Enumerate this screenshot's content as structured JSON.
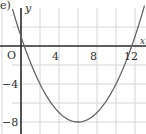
{
  "part_label": "e)",
  "chart_data": {
    "type": "line",
    "title": "",
    "xlabel": "x",
    "ylabel": "y",
    "origin_label": "O",
    "x_ticks": [
      4,
      8,
      12
    ],
    "y_ticks": [
      -4,
      -8
    ],
    "x_tick_labels": [
      "4",
      "8",
      "12"
    ],
    "y_tick_labels": [
      "−4",
      "−8"
    ],
    "xlim": [
      -2,
      13
    ],
    "ylim": [
      -9,
      4
    ],
    "grid": true,
    "grid_step": 2,
    "series": [
      {
        "name": "parabola",
        "equation": "y = 0.25(x-6)^2 - 8",
        "x": [
          -1,
          0,
          1,
          2,
          3,
          4,
          5,
          6,
          7,
          8,
          9,
          10,
          11,
          12,
          13
        ],
        "values": [
          4.25,
          1,
          -1.75,
          -4,
          -5.75,
          -7,
          -7.75,
          -8,
          -7.75,
          -7,
          -5.75,
          -4,
          -1.75,
          1,
          4.25
        ]
      }
    ],
    "vertex": [
      6,
      -8
    ],
    "roots": [
      0.34,
      11.66
    ],
    "y_intercept": 1
  }
}
